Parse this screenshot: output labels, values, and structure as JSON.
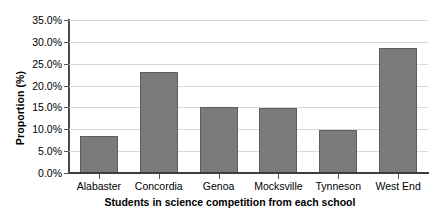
{
  "chart_data": {
    "type": "bar",
    "title": "",
    "xlabel": "Students in science competition from each school",
    "ylabel": "Proportion (%)",
    "categories": [
      "Alabaster",
      "Concordia",
      "Genoa",
      "Mocksville",
      "Tynneson",
      "West End"
    ],
    "values": [
      8.5,
      23.0,
      15.0,
      14.8,
      9.8,
      28.5
    ],
    "ylim": [
      0,
      35
    ],
    "ytick_labels": [
      "0.0%",
      "5.0%",
      "10.0%",
      "15.0%",
      "20.0%",
      "25.0%",
      "30.0%",
      "35.0%"
    ],
    "ytick_values": [
      0,
      5,
      10,
      15,
      20,
      25,
      30,
      35
    ],
    "grid": true,
    "legend": false,
    "bar_color": "#7b7b7b",
    "bar_border_color": "#5d5d5d",
    "gridline_color": "#d8d8d8",
    "axis_color": "#3d3d3d",
    "background_color": "#ffffff"
  }
}
